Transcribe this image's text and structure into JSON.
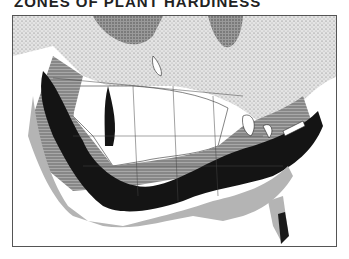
{
  "title": "ZONES OF PLANT HARDINESS",
  "map": {
    "region": "United States and southern Canada",
    "style": "black-and-white scanned zone map",
    "zones": [
      {
        "name": "far-north",
        "pattern": "dense stipple",
        "color": "#8a8a8a"
      },
      {
        "name": "canada-south",
        "pattern": "light stipple",
        "color": "#d6d6d6"
      },
      {
        "name": "northern-plains",
        "pattern": "white",
        "color": "#ffffff"
      },
      {
        "name": "central",
        "pattern": "horizontal hatching",
        "color": "#9a9a9a"
      },
      {
        "name": "mid-south",
        "pattern": "solid dark",
        "color": "#111111"
      },
      {
        "name": "gulf-coast",
        "pattern": "medium grey",
        "color": "#b0b0b0"
      },
      {
        "name": "subtropical",
        "pattern": "dark",
        "color": "#1a1a1a"
      }
    ]
  }
}
